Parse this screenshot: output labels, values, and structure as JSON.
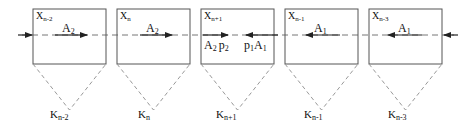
{
  "diagram": {
    "type": "sequence-of-cells",
    "colors": {
      "stroke": "#555555",
      "dash": "#777777",
      "text": "#111111",
      "background": "#ffffff"
    },
    "cells": [
      {
        "x_label": "X",
        "x_sub": "n-2",
        "flow_label": "A",
        "flow_sub": "2",
        "flow_dir": "right",
        "k_label": "K",
        "k_sub": "n-2"
      },
      {
        "x_label": "X",
        "x_sub": "n",
        "flow_label": "A",
        "flow_sub": "2",
        "flow_dir": "right",
        "k_label": "K",
        "k_sub": "n"
      },
      {
        "x_label": "X",
        "x_sub": "n+1",
        "flow_label": "",
        "flow_sub": "",
        "flow_dir": "both",
        "k_label": "K",
        "k_sub": "n+1",
        "left_label": "A",
        "left_sub": "2",
        "left_p": "p",
        "left_p_sub": "2",
        "right_p": "p",
        "right_p_sub": "1",
        "right_label": "A",
        "right_sub": "1"
      },
      {
        "x_label": "X",
        "x_sub": "n-1",
        "flow_label": "A",
        "flow_sub": "1",
        "flow_dir": "left",
        "k_label": "K",
        "k_sub": "n-1"
      },
      {
        "x_label": "X",
        "x_sub": "n-3",
        "flow_label": "A",
        "flow_sub": "1",
        "flow_dir": "left",
        "k_label": "K",
        "k_sub": "n-3"
      }
    ],
    "boundary_arrows": {
      "left": "inward",
      "right": "inward"
    }
  }
}
